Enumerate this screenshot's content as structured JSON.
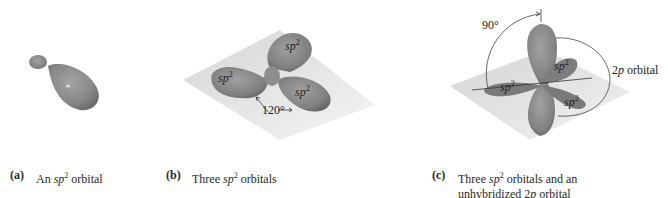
{
  "figure": {
    "panels": [
      {
        "id": "a",
        "letter": "(a)",
        "caption_pre": "An ",
        "caption_sp": "sp",
        "caption_sup": "2",
        "caption_post": " orbital",
        "caption_line2": ""
      },
      {
        "id": "b",
        "letter": "(b)",
        "caption_pre": "Three ",
        "caption_sp": "sp",
        "caption_sup": "2",
        "caption_post": " orbitals",
        "caption_line2": "",
        "lobe_labels": [
          {
            "base": "sp",
            "sup": "2"
          },
          {
            "base": "sp",
            "sup": "2"
          },
          {
            "base": "sp",
            "sup": "2"
          }
        ],
        "angle_label": "120°"
      },
      {
        "id": "c",
        "letter": "(c)",
        "caption_pre": "Three ",
        "caption_sp": "sp",
        "caption_sup": "2",
        "caption_post": " orbitals and an",
        "caption_line2_pre": "unhybridized 2",
        "caption_line2_p": "p",
        "caption_line2_post": " orbital",
        "lobe_labels": [
          {
            "base": "sp",
            "sup": "2"
          },
          {
            "base": "sp",
            "sup": "2"
          },
          {
            "base": "sp",
            "sup": "2"
          }
        ],
        "angle_label": "90°",
        "p_orbital_label_num": "2",
        "p_orbital_label_p": "p",
        "p_orbital_label_rest": " orbital"
      }
    ],
    "colors": {
      "lobe": "#8a8a8a",
      "lobe_dark": "#6e6e6e",
      "plane": "#e2e2e2",
      "line": "#333333"
    }
  }
}
